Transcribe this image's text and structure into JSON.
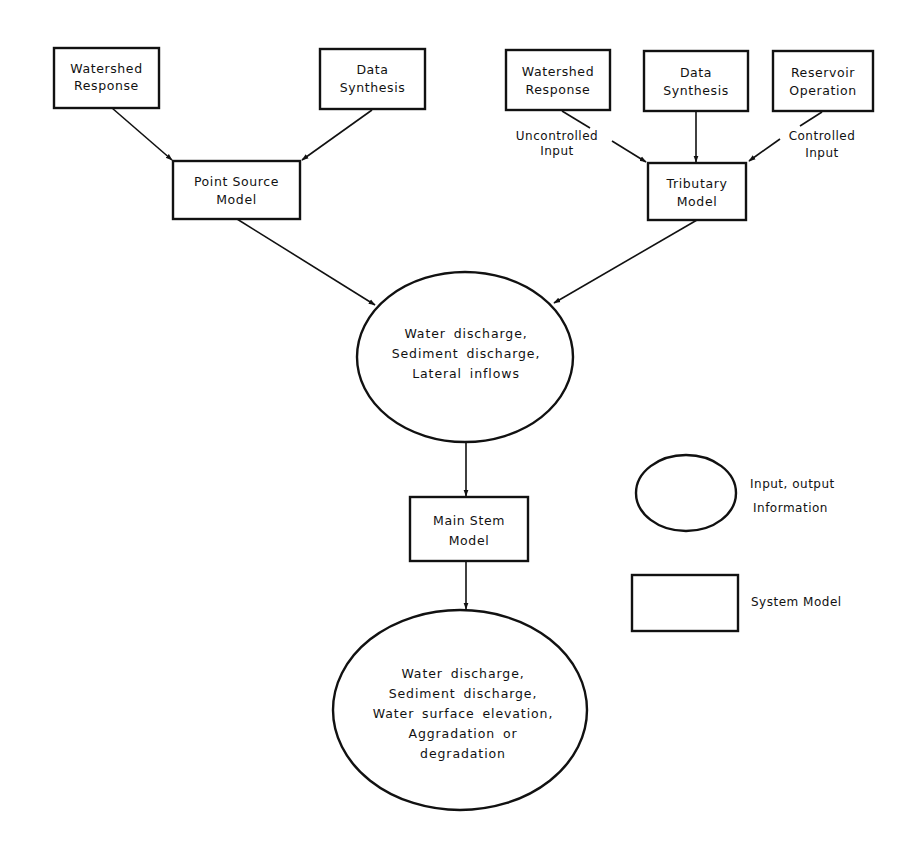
{
  "diagram": {
    "colors": {
      "stroke": "#111111",
      "background": "#ffffff"
    },
    "nodes": {
      "watershed_left": {
        "type": "system-model",
        "lines": [
          "Watershed",
          "Response"
        ]
      },
      "data_synthesis_left": {
        "type": "system-model",
        "lines": [
          "Data",
          "Synthesis"
        ]
      },
      "point_source": {
        "type": "system-model",
        "lines": [
          "Point Source",
          "Model"
        ]
      },
      "watershed_right": {
        "type": "system-model",
        "lines": [
          "Watershed",
          "Response"
        ]
      },
      "data_synthesis_right": {
        "type": "system-model",
        "lines": [
          "Data",
          "Synthesis"
        ]
      },
      "reservoir_operation": {
        "type": "system-model",
        "lines": [
          "Reservoir",
          "Operation"
        ]
      },
      "tributary": {
        "type": "system-model",
        "lines": [
          "Tributary",
          "Model"
        ]
      },
      "inflows_info": {
        "type": "input-output-information",
        "lines": [
          "Water discharge,",
          "Sediment discharge,",
          "Lateral inflows"
        ]
      },
      "main_stem": {
        "type": "system-model",
        "lines": [
          "Main Stem",
          "Model"
        ]
      },
      "outputs_info": {
        "type": "input-output-information",
        "lines": [
          "Water discharge,",
          "Sediment discharge,",
          "Water surface elevation,",
          "Aggradation or",
          "degradation"
        ]
      }
    },
    "edge_labels": {
      "uncontrolled": [
        "Uncontrolled",
        "Input"
      ],
      "controlled": [
        "Controlled",
        "Input"
      ]
    },
    "edges": [
      {
        "from": "watershed_left",
        "to": "point_source"
      },
      {
        "from": "data_synthesis_left",
        "to": "point_source"
      },
      {
        "from": "watershed_right",
        "to": "tributary",
        "label": "Uncontrolled Input"
      },
      {
        "from": "data_synthesis_right",
        "to": "tributary"
      },
      {
        "from": "reservoir_operation",
        "to": "tributary",
        "label": "Controlled Input"
      },
      {
        "from": "point_source",
        "to": "inflows_info"
      },
      {
        "from": "tributary",
        "to": "inflows_info"
      },
      {
        "from": "inflows_info",
        "to": "main_stem"
      },
      {
        "from": "main_stem",
        "to": "outputs_info"
      }
    ],
    "legend": {
      "ellipse": [
        "Input, output",
        "Information"
      ],
      "rectangle": "System Model"
    }
  }
}
